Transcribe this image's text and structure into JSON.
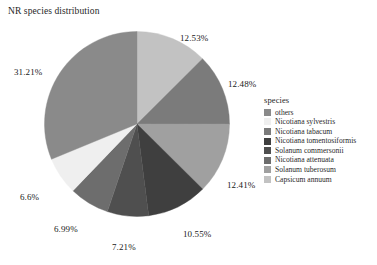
{
  "chart_title": "NR species distribution",
  "legend": {
    "title": "species"
  },
  "bottom_caption": "",
  "chart_data": {
    "type": "pie",
    "title": "NR species distribution",
    "legend_title": "species",
    "legend_position": "right",
    "grid": false,
    "unit": "%",
    "start_angle_deg": 0,
    "direction": "clockwise",
    "categories": [
      "others",
      "Nicotiana sylvestris",
      "Nicotiana tabacum",
      "Nicotiana tomentosiformis",
      "Solanum commersonii",
      "Nicotiana attenuata",
      "Solanum tuberosum",
      "Capsicum annuum"
    ],
    "colors": [
      "#8a8a8a",
      "#efefef",
      "#7b7b7b",
      "#3f3f3f",
      "#4f4f4f",
      "#6d6d6d",
      "#a0a0a0",
      "#c2c2c2"
    ],
    "values": [
      31.21,
      6.6,
      12.48,
      10.55,
      7.21,
      6.99,
      12.41,
      12.53
    ],
    "slices": [
      {
        "label": "Capsicum annuum",
        "value": 12.53,
        "display": "12.53%",
        "color": "#c2c2c2"
      },
      {
        "label": "Nicotiana tabacum",
        "value": 12.48,
        "display": "12.48%",
        "color": "#7b7b7b"
      },
      {
        "label": "Solanum tuberosum",
        "value": 12.41,
        "display": "12.41%",
        "color": "#a0a0a0"
      },
      {
        "label": "Nicotiana tomentosiformis",
        "value": 10.55,
        "display": "10.55%",
        "color": "#3f3f3f"
      },
      {
        "label": "Solanum commersonii",
        "value": 7.21,
        "display": "7.21%",
        "color": "#4f4f4f"
      },
      {
        "label": "Nicotiana attenuata",
        "value": 6.99,
        "display": "6.99%",
        "color": "#6d6d6d"
      },
      {
        "label": "Nicotiana sylvestris",
        "value": 6.6,
        "display": "6.6%",
        "color": "#efefef"
      },
      {
        "label": "others",
        "value": 31.21,
        "display": "31.21%",
        "color": "#8a8a8a"
      }
    ],
    "legend_entries": [
      {
        "label": "others",
        "color": "#8a8a8a"
      },
      {
        "label": "Nicotiana sylvestris",
        "color": "#efefef"
      },
      {
        "label": "Nicotiana tabacum",
        "color": "#7b7b7b"
      },
      {
        "label": "Nicotiana tomentosiformis",
        "color": "#3f3f3f"
      },
      {
        "label": "Solanum commersonii",
        "color": "#4f4f4f"
      },
      {
        "label": "Nicotiana attenuata",
        "color": "#6d6d6d"
      },
      {
        "label": "Solanum tuberosum",
        "color": "#a0a0a0"
      },
      {
        "label": "Capsicum annuum",
        "color": "#c2c2c2"
      }
    ],
    "labels": [
      {
        "display": "12.53%",
        "x": 180,
        "y": 33,
        "anchor": "start"
      },
      {
        "display": "12.48%",
        "x": 228,
        "y": 79,
        "anchor": "start"
      },
      {
        "display": "12.41%",
        "x": 227,
        "y": 180,
        "anchor": "start"
      },
      {
        "display": "10.55%",
        "x": 183,
        "y": 229,
        "anchor": "start"
      },
      {
        "display": "7.21%",
        "x": 112,
        "y": 242,
        "anchor": "start"
      },
      {
        "display": "6.99%",
        "x": 54,
        "y": 224,
        "anchor": "start"
      },
      {
        "display": "6.6%",
        "x": 20,
        "y": 192,
        "anchor": "start"
      },
      {
        "display": "31.21%",
        "x": 14,
        "y": 67,
        "anchor": "start"
      }
    ]
  }
}
